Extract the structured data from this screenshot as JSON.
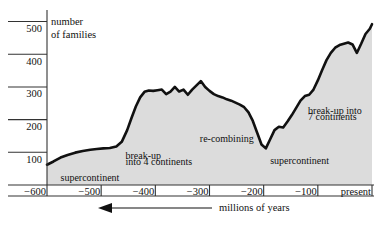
{
  "chart_data": {
    "type": "area",
    "title": "",
    "xlabel": "millions of years",
    "ylabel": "number of families",
    "xlim": [
      -600,
      0
    ],
    "ylim": [
      0,
      540
    ],
    "grid": false,
    "legend": null,
    "y_ticks": [
      100,
      200,
      300,
      400,
      500
    ],
    "y_tick_labels": [
      "100",
      "200",
      "300",
      "400",
      "500"
    ],
    "x_ticks": [
      -600,
      -500,
      -400,
      -300,
      -200,
      -100,
      0
    ],
    "x_tick_labels": [
      "-600",
      "-500",
      "-400",
      "-300",
      "-200",
      "-100",
      "present"
    ],
    "x_axis_direction_note": "arrow points left toward older times",
    "series": [
      {
        "name": "number of families",
        "x": [
          -600,
          -588,
          -575,
          -562,
          -548,
          -534,
          -520,
          -508,
          -496,
          -484,
          -472,
          -462,
          -452,
          -444,
          -436,
          -428,
          -420,
          -412,
          -404,
          -396,
          -388,
          -380,
          -372,
          -364,
          -356,
          -348,
          -340,
          -332,
          -324,
          -316,
          -308,
          -300,
          -292,
          -284,
          -276,
          -268,
          -260,
          -252,
          -244,
          -236,
          -228,
          -220,
          -212,
          -204,
          -196,
          -188,
          -180,
          -172,
          -164,
          -156,
          -148,
          -140,
          -132,
          -124,
          -116,
          -108,
          -100,
          -92,
          -84,
          -76,
          -68,
          -60,
          -52,
          -44,
          -36,
          -28,
          -20,
          -12,
          -4,
          0
        ],
        "values": [
          62,
          72,
          84,
          92,
          99,
          104,
          108,
          110,
          112,
          113,
          118,
          132,
          168,
          205,
          240,
          268,
          285,
          289,
          288,
          290,
          292,
          278,
          286,
          300,
          286,
          292,
          276,
          292,
          305,
          318,
          300,
          288,
          278,
          272,
          268,
          262,
          258,
          252,
          246,
          238,
          222,
          196,
          160,
          124,
          112,
          140,
          168,
          178,
          176,
          194,
          214,
          236,
          258,
          272,
          276,
          292,
          320,
          352,
          382,
          404,
          420,
          428,
          432,
          436,
          430,
          404,
          432,
          462,
          478,
          492
        ]
      }
    ],
    "annotations": [
      {
        "text": "supercontinent",
        "x": -575,
        "y": 40,
        "name": "annotation-supercontinent-left"
      },
      {
        "text": "break-up",
        "x": -455,
        "y": 108,
        "name": "annotation-breakup-4-line1"
      },
      {
        "text": "into 4 continents",
        "x": -455,
        "y": 88,
        "name": "annotation-breakup-4-line2"
      },
      {
        "text": "re-combining",
        "x": -318,
        "y": 160,
        "name": "annotation-recombining"
      },
      {
        "text": "supercontinent",
        "x": -188,
        "y": 92,
        "name": "annotation-supercontinent-right"
      },
      {
        "text": "break-up into",
        "x": -118,
        "y": 246,
        "name": "annotation-breakup-7-line1"
      },
      {
        "text": "7 continents",
        "x": -118,
        "y": 228,
        "name": "annotation-breakup-7-line2"
      }
    ],
    "style": {
      "area_fill": "#dcdcdc",
      "line_color": "#111111",
      "axis_color": "#333333",
      "background": "#ffffff"
    }
  },
  "axis": {
    "y_title_line1": "number",
    "y_title_line2": "of families",
    "x_units": "millions of years"
  }
}
